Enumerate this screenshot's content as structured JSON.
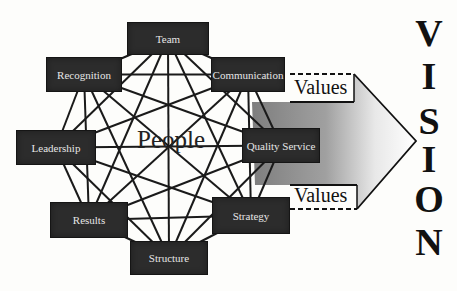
{
  "center_label": "People",
  "nodes": [
    {
      "id": "team",
      "label": "Team",
      "x": 127,
      "y": 22,
      "w": 82,
      "h": 33
    },
    {
      "id": "communication",
      "label": "Communication",
      "x": 211,
      "y": 57,
      "w": 74,
      "h": 35
    },
    {
      "id": "quality_service",
      "label": "Quality Service",
      "x": 242,
      "y": 128,
      "w": 78,
      "h": 35
    },
    {
      "id": "strategy",
      "label": "Strategy",
      "x": 212,
      "y": 197,
      "w": 78,
      "h": 37
    },
    {
      "id": "structure",
      "label": "Structure",
      "x": 130,
      "y": 241,
      "w": 78,
      "h": 34
    },
    {
      "id": "results",
      "label": "Results",
      "x": 50,
      "y": 202,
      "w": 78,
      "h": 36
    },
    {
      "id": "leadership",
      "label": "Leadership",
      "x": 16,
      "y": 130,
      "w": 80,
      "h": 35
    },
    {
      "id": "recognition",
      "label": "Recognition",
      "x": 46,
      "y": 57,
      "w": 76,
      "h": 35
    }
  ],
  "arrow": {
    "top_label": "Values",
    "bottom_label": "Values",
    "fill_start": "#7e7e7e",
    "fill_end": "#ffffff"
  },
  "vision": {
    "word": "VISION",
    "letters": [
      "V",
      "I",
      "S",
      "I",
      "O",
      "N"
    ]
  },
  "colors": {
    "box_fill": "#2c2c2c",
    "box_text": "#e6e6e6",
    "line": "#1a1a1a",
    "background": "#fdfdfb"
  }
}
